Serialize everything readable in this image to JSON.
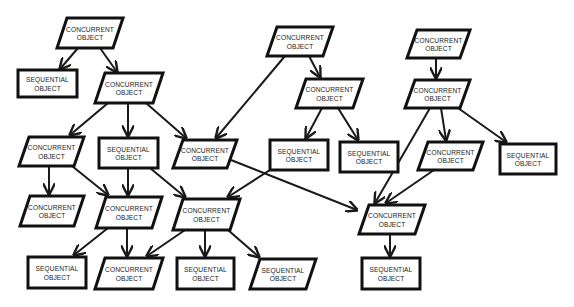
{
  "diagram": {
    "title": "",
    "colors": {
      "stroke": "#111111",
      "fill": "#ffffff",
      "text": "#222222",
      "background": "#ffffff"
    },
    "labels": {
      "concurrent": [
        "CONCURRENT",
        "OBJECT"
      ],
      "sequential": [
        "SEQUENTIAL",
        "OBJECT"
      ]
    },
    "nodes": [
      {
        "id": "n1",
        "kind": "concurrent",
        "shape": "parallelogram",
        "x": 57,
        "y": 18,
        "w": 66,
        "h": 30,
        "line1": "CONCURRENT",
        "line2": "OBJECT"
      },
      {
        "id": "n2",
        "kind": "sequential",
        "shape": "rect",
        "x": 18,
        "y": 70,
        "w": 59,
        "h": 27,
        "line1": "SEQUENTIAL",
        "line2": "OBJECT"
      },
      {
        "id": "n3",
        "kind": "concurrent",
        "shape": "parallelogram",
        "x": 95,
        "y": 73,
        "w": 68,
        "h": 30,
        "line1": "CONCURRENT",
        "line2": "OBJECT"
      },
      {
        "id": "n4",
        "kind": "concurrent",
        "shape": "parallelogram",
        "x": 19,
        "y": 137,
        "w": 65,
        "h": 29,
        "line1": "CONCURRENT",
        "line2": "OBJECT"
      },
      {
        "id": "n5",
        "kind": "sequential",
        "shape": "rect",
        "x": 99,
        "y": 138,
        "w": 59,
        "h": 30,
        "line1": "SEQUENTIAL",
        "line2": "OBJECT"
      },
      {
        "id": "n6",
        "kind": "concurrent",
        "shape": "parallelogram",
        "x": 173,
        "y": 140,
        "w": 64,
        "h": 28,
        "line1": "CONCURRENT",
        "line2": "OBJECT"
      },
      {
        "id": "n7",
        "kind": "concurrent",
        "shape": "parallelogram",
        "x": 267,
        "y": 27,
        "w": 66,
        "h": 29,
        "line1": "CONCURRENT",
        "line2": "OBJECT"
      },
      {
        "id": "n8",
        "kind": "concurrent",
        "shape": "parallelogram",
        "x": 296,
        "y": 79,
        "w": 67,
        "h": 29,
        "line1": "CONCURRENT",
        "line2": "OBJECT"
      },
      {
        "id": "n9",
        "kind": "sequential",
        "shape": "rect",
        "x": 270,
        "y": 140,
        "w": 58,
        "h": 30,
        "line1": "SEQUENTIAL",
        "line2": "OBJECT"
      },
      {
        "id": "n10",
        "kind": "sequential",
        "shape": "rect",
        "x": 340,
        "y": 142,
        "w": 58,
        "h": 30,
        "line1": "SEQUENTIAL",
        "line2": "OBJECT"
      },
      {
        "id": "n11",
        "kind": "concurrent",
        "shape": "parallelogram",
        "x": 407,
        "y": 30,
        "w": 63,
        "h": 28,
        "line1": "CONCURRENT",
        "line2": "OBJECT"
      },
      {
        "id": "n12",
        "kind": "concurrent",
        "shape": "parallelogram",
        "x": 405,
        "y": 80,
        "w": 65,
        "h": 28,
        "line1": "CONCURRENT",
        "line2": "OBJECT"
      },
      {
        "id": "n13",
        "kind": "concurrent",
        "shape": "parallelogram",
        "x": 418,
        "y": 142,
        "w": 65,
        "h": 28,
        "line1": "CONCURRENT",
        "line2": "OBJECT"
      },
      {
        "id": "n14",
        "kind": "sequential",
        "shape": "rect",
        "x": 500,
        "y": 144,
        "w": 56,
        "h": 30,
        "line1": "SEQUENTIAL",
        "line2": "OBJECT"
      },
      {
        "id": "n15",
        "kind": "concurrent",
        "shape": "parallelogram",
        "x": 20,
        "y": 196,
        "w": 64,
        "h": 30,
        "line1": "CONCURRENT",
        "line2": "OBJECT"
      },
      {
        "id": "n16",
        "kind": "concurrent",
        "shape": "parallelogram",
        "x": 96,
        "y": 197,
        "w": 66,
        "h": 31,
        "line1": "CONCURRENT",
        "line2": "OBJECT"
      },
      {
        "id": "n17",
        "kind": "concurrent",
        "shape": "parallelogram",
        "x": 173,
        "y": 199,
        "w": 67,
        "h": 31,
        "line1": "CONCURRENT",
        "line2": "OBJECT"
      },
      {
        "id": "n18",
        "kind": "concurrent",
        "shape": "parallelogram",
        "x": 359,
        "y": 205,
        "w": 66,
        "h": 29,
        "line1": "CONCURRENT",
        "line2": "OBJECT"
      },
      {
        "id": "n19",
        "kind": "sequential",
        "shape": "rect",
        "x": 28,
        "y": 257,
        "w": 58,
        "h": 31,
        "line1": "SEQUENTIAL",
        "line2": "OBJECT"
      },
      {
        "id": "n20",
        "kind": "concurrent",
        "shape": "parallelogram",
        "x": 95,
        "y": 258,
        "w": 68,
        "h": 31,
        "line1": "CONCURRENT",
        "line2": "OBJECT"
      },
      {
        "id": "n21",
        "kind": "sequential",
        "shape": "rect",
        "x": 177,
        "y": 258,
        "w": 57,
        "h": 31,
        "line1": "SEQUENTIAL",
        "line2": "OBJECT"
      },
      {
        "id": "n22",
        "kind": "sequential",
        "shape": "parallelogram",
        "x": 250,
        "y": 259,
        "w": 66,
        "h": 30,
        "line1": "SEQUENTIAL",
        "line2": "OBJECT"
      },
      {
        "id": "n23",
        "kind": "sequential",
        "shape": "rect",
        "x": 362,
        "y": 258,
        "w": 58,
        "h": 31,
        "line1": "SEQUENTIAL",
        "line2": "OBJECT"
      }
    ],
    "edges": [
      {
        "from": "n1",
        "to": "n2",
        "x1": 78,
        "y1": 48,
        "x2": 60,
        "y2": 69
      },
      {
        "from": "n1",
        "to": "n3",
        "x1": 100,
        "y1": 48,
        "x2": 117,
        "y2": 72
      },
      {
        "from": "n3",
        "to": "n4",
        "x1": 108,
        "y1": 103,
        "x2": 70,
        "y2": 135
      },
      {
        "from": "n3",
        "to": "n5",
        "x1": 128,
        "y1": 103,
        "x2": 128,
        "y2": 136
      },
      {
        "from": "n3",
        "to": "n6",
        "x1": 146,
        "y1": 103,
        "x2": 186,
        "y2": 138
      },
      {
        "from": "n7",
        "to": "n6",
        "x1": 285,
        "y1": 56,
        "x2": 216,
        "y2": 138
      },
      {
        "from": "n7",
        "to": "n8",
        "x1": 309,
        "y1": 56,
        "x2": 320,
        "y2": 77
      },
      {
        "from": "n8",
        "to": "n9",
        "x1": 322,
        "y1": 108,
        "x2": 306,
        "y2": 138
      },
      {
        "from": "n8",
        "to": "n10",
        "x1": 338,
        "y1": 108,
        "x2": 358,
        "y2": 140
      },
      {
        "from": "n11",
        "to": "n12",
        "x1": 436,
        "y1": 58,
        "x2": 436,
        "y2": 78
      },
      {
        "from": "n12",
        "to": "n18",
        "x1": 430,
        "y1": 108,
        "x2": 375,
        "y2": 203
      },
      {
        "from": "n12",
        "to": "n13",
        "x1": 441,
        "y1": 108,
        "x2": 446,
        "y2": 140
      },
      {
        "from": "n12",
        "to": "n14",
        "x1": 458,
        "y1": 108,
        "x2": 506,
        "y2": 142
      },
      {
        "from": "n13",
        "to": "n18",
        "x1": 434,
        "y1": 170,
        "x2": 386,
        "y2": 203
      },
      {
        "from": "n6",
        "to": "n18",
        "x1": 231,
        "y1": 160,
        "x2": 357,
        "y2": 210
      },
      {
        "from": "n9",
        "to": "n17",
        "x1": 273,
        "y1": 168,
        "x2": 228,
        "y2": 197
      },
      {
        "from": "n4",
        "to": "n15",
        "x1": 49,
        "y1": 166,
        "x2": 49,
        "y2": 194
      },
      {
        "from": "n4",
        "to": "n16",
        "x1": 72,
        "y1": 166,
        "x2": 108,
        "y2": 195
      },
      {
        "from": "n5",
        "to": "n16",
        "x1": 128,
        "y1": 168,
        "x2": 128,
        "y2": 195
      },
      {
        "from": "n5",
        "to": "n17",
        "x1": 150,
        "y1": 168,
        "x2": 185,
        "y2": 197
      },
      {
        "from": "n16",
        "to": "n19",
        "x1": 108,
        "y1": 228,
        "x2": 74,
        "y2": 255
      },
      {
        "from": "n16",
        "to": "n20",
        "x1": 127,
        "y1": 228,
        "x2": 127,
        "y2": 256
      },
      {
        "from": "n17",
        "to": "n20",
        "x1": 185,
        "y1": 230,
        "x2": 147,
        "y2": 256
      },
      {
        "from": "n17",
        "to": "n21",
        "x1": 205,
        "y1": 230,
        "x2": 205,
        "y2": 256
      },
      {
        "from": "n17",
        "to": "n22",
        "x1": 228,
        "y1": 230,
        "x2": 259,
        "y2": 257
      },
      {
        "from": "n18",
        "to": "n23",
        "x1": 390,
        "y1": 234,
        "x2": 390,
        "y2": 256
      }
    ]
  }
}
